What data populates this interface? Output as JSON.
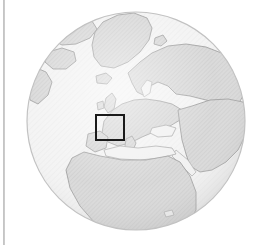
{
  "figure": {
    "kind": "globe-locator-map",
    "title": "Orthographic globe locator map centred on Europe and Africa",
    "caption": "",
    "background_color": "#ffffff"
  },
  "page": {
    "left_margin_rule": {
      "visible": true,
      "color": "#bdbdbd",
      "x": 3,
      "width": 2
    }
  },
  "globe": {
    "projection": "orthographic",
    "center_x": 136,
    "center_y": 121,
    "radius": 110,
    "ocean_color": "#f2f2f2",
    "land_color": "#d6d6d6",
    "coast_color": "#9a9a9a",
    "rim_color": "#c4c4c4",
    "shading": "subtle-limb-darkening",
    "land_texture": "fine diagonal stipple"
  },
  "highlight": {
    "label": "region-of-interest",
    "shape": "rectangle",
    "stroke_color": "#1a1a1a",
    "stroke_width": 2,
    "fill": "none",
    "x": 95,
    "y": 114,
    "width": 30,
    "height": 27,
    "covers": "Western Europe"
  },
  "chart_data": {
    "type": "map",
    "title": "Orthographic globe locator map centred on Europe and Africa",
    "projection": "orthographic",
    "center_lon": 10,
    "center_lat": 30,
    "visible_regions": [
      "Greenland",
      "Arctic Canada",
      "Iceland",
      "Scandinavia",
      "British Isles",
      "Western Europe",
      "Eastern Europe",
      "Mediterranean Sea",
      "Black Sea",
      "Caspian Sea",
      "Aral Sea",
      "Arabian Peninsula",
      "North Africa",
      "West Africa",
      "Central Africa"
    ],
    "inset_box": {
      "label": "Western Europe",
      "lon_range": [
        -6,
        12
      ],
      "lat_range": [
        41,
        54
      ]
    },
    "legend": [],
    "grid": false
  }
}
